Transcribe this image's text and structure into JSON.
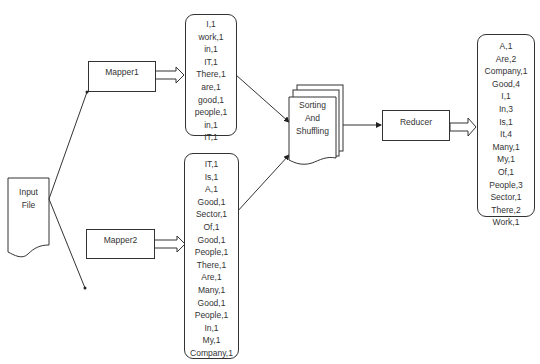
{
  "diagram": {
    "type": "MapReduce word count flow",
    "input": {
      "label_line1": "Input",
      "label_line2": "File"
    },
    "mapper1": {
      "label": "Mapper1",
      "output": [
        "I,1",
        "work,1",
        "in,1",
        "IT,1",
        "There,1",
        "are,1",
        "good,1",
        "people,1",
        "in,1",
        "IT,1"
      ]
    },
    "mapper2": {
      "label": "Mapper2",
      "output": [
        "IT,1",
        "Is,1",
        "A,1",
        "Good,1",
        "Sector,1",
        "Of,1",
        "Good,1",
        "People,1",
        "There,1",
        "Are,1",
        "Many,1",
        "Good,1",
        "People,1",
        "In,1",
        "My,1",
        "Company,1"
      ]
    },
    "shuffle": {
      "line1": "Sorting",
      "line2": "And",
      "line3": "Shuffling"
    },
    "reducer": {
      "label": "Reducer",
      "output": [
        "A,1",
        "Are,2",
        "Company,1",
        "Good,4",
        "I,1",
        "In,3",
        "Is,1",
        "It,4",
        "Many,1",
        "My,1",
        "Of,1",
        "People,3",
        "Sector,1",
        "There,2",
        "Work,1"
      ]
    },
    "edges": [
      {
        "from": "Input File",
        "to": "Mapper1"
      },
      {
        "from": "Input File",
        "to": "Mapper2"
      },
      {
        "from": "Mapper1",
        "to": "Mapper1 output"
      },
      {
        "from": "Mapper2",
        "to": "Mapper2 output"
      },
      {
        "from": "Mapper1 output",
        "to": "Sorting And Shuffling"
      },
      {
        "from": "Mapper2 output",
        "to": "Sorting And Shuffling"
      },
      {
        "from": "Sorting And Shuffling",
        "to": "Reducer"
      },
      {
        "from": "Reducer",
        "to": "Reducer output"
      }
    ]
  }
}
